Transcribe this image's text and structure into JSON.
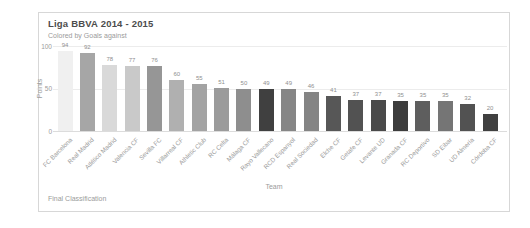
{
  "card": {
    "title": "Liga BBVA 2014 - 2015",
    "subtitle": "Colored by Goals against",
    "caption": "Final Classification"
  },
  "chart_data": {
    "type": "bar",
    "title": "Liga BBVA 2014 - 2015",
    "subtitle": "Colored by Goals against",
    "caption": "Final Classification",
    "xlabel": "Team",
    "ylabel": "Points",
    "ylim": [
      0,
      100
    ],
    "yticks": [
      0,
      50,
      100
    ],
    "grid": "horizontal",
    "legend": "none",
    "categories": [
      "FC Barcelona",
      "Real Madrid",
      "Atlético Madrid",
      "Valencia CF",
      "Sevilla FC",
      "Villarreal CF",
      "Athletic Club",
      "RC Celta",
      "Málaga CF",
      "Rayo Vallecano",
      "RCD Espanyol",
      "Real Sociedad",
      "Elche CF",
      "Getafe CF",
      "Levante UD",
      "Granada CF",
      "RC Deportivo",
      "SD Eibar",
      "UD Almería",
      "Córdoba CF"
    ],
    "values": [
      94,
      92,
      78,
      77,
      76,
      60,
      55,
      51,
      50,
      49,
      49,
      46,
      41,
      37,
      37,
      35,
      35,
      35,
      32,
      20
    ],
    "bar_colors": [
      "#f0f0f0",
      "#a6a6a6",
      "#d9d9d9",
      "#c9c9c9",
      "#969696",
      "#b0b0b0",
      "#a3a3a3",
      "#9b9b9b",
      "#8e8e8e",
      "#404040",
      "#868686",
      "#848484",
      "#575757",
      "#525252",
      "#4a4a4a",
      "#3d3d3d",
      "#5e5e5e",
      "#757575",
      "#525252",
      "#404040"
    ]
  }
}
